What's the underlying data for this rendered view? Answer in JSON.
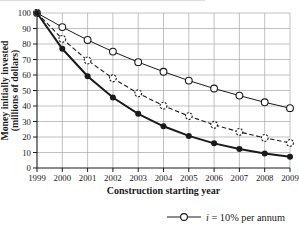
{
  "chart_data": {
    "type": "line",
    "title": "",
    "xlabel": "Construction starting year",
    "ylabel_line1": "Money initially invested",
    "ylabel_line2": "(millions of dollars)",
    "x": [
      1999,
      2000,
      2001,
      2002,
      2003,
      2004,
      2005,
      2006,
      2007,
      2008,
      2009
    ],
    "xlim": [
      1999,
      2009
    ],
    "ylim": [
      0,
      100
    ],
    "ytick_step": 10,
    "ytick_labels": [
      "0",
      "10",
      "20",
      "30",
      "40",
      "50",
      "60",
      "70",
      "80",
      "90",
      "100"
    ],
    "xtick_labels": [
      "1999",
      "2000",
      "2001",
      "2002",
      "2003",
      "2004",
      "2005",
      "2006",
      "2007",
      "2008",
      "2009"
    ],
    "grid": true,
    "series": [
      {
        "name": "i = 10% per annum",
        "legend_visible": true,
        "line": "solid-thin",
        "marker": "open-circle",
        "values": [
          100,
          90.9,
          82.6,
          75.1,
          68.3,
          62.1,
          56.4,
          51.3,
          46.7,
          42.4,
          38.6
        ]
      },
      {
        "name": "unlabeled (legend cropped, dashed line, dashed open markers)",
        "legend_visible": false,
        "line": "dashed",
        "marker": "open-circle-dashed",
        "values": [
          100,
          83.3,
          69.4,
          57.9,
          48.2,
          40.2,
          33.5,
          27.9,
          23.3,
          19.4,
          16.2
        ]
      },
      {
        "name": "unlabeled (legend cropped, thick solid line, filled markers)",
        "legend_visible": false,
        "line": "solid-thick",
        "marker": "filled-circle",
        "values": [
          100,
          76.9,
          59.2,
          45.5,
          35.0,
          26.9,
          20.7,
          15.9,
          12.3,
          9.4,
          7.3
        ]
      }
    ],
    "legend": {
      "position": "bottom-right",
      "entries_visible": [
        {
          "marker": "open-circle",
          "label_italic": "i",
          "label_rest": " = 10% per annum"
        }
      ]
    }
  },
  "colors": {
    "line": "#1a1a1a",
    "grid": "#a6a6a6",
    "background": "#ffffff",
    "crop_fragment": "#dcdcdc"
  }
}
